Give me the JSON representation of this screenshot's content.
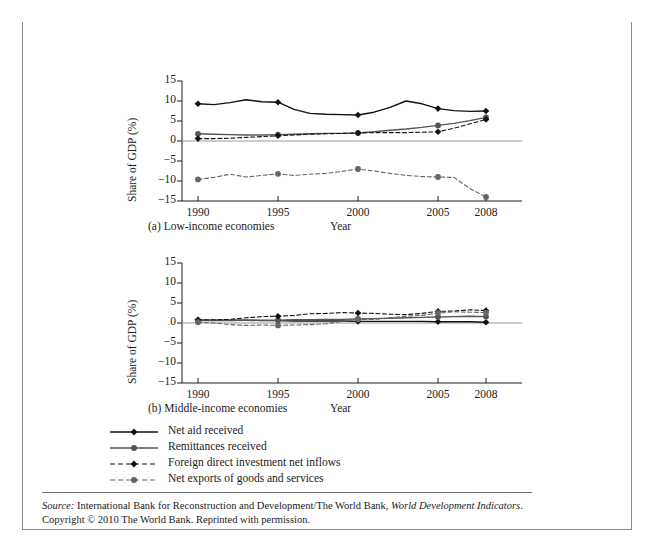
{
  "figure": {
    "number_label": "FIGURE 14.3",
    "title": "Sources of External Financing for Developing Countries, 1990–2008"
  },
  "source": {
    "label": "Source:",
    "line1_rest": " International Bank for Reconstruction and Development/The World Bank, ",
    "italic_work": "World Development Indicators",
    "line1_end": ".",
    "line2": "Copyright © 2010 The World Bank. Reprinted with permission."
  },
  "legend": {
    "items": [
      {
        "label": "Net aid received",
        "style": "solid",
        "marker": "diamond",
        "color": "#111111",
        "key": "net-aid-received"
      },
      {
        "label": "Remittances received",
        "style": "solid",
        "marker": "circle",
        "color": "#555555",
        "key": "remittances-received"
      },
      {
        "label": "Foreign direct investment net inflows",
        "style": "dashed",
        "marker": "diamond",
        "color": "#111111",
        "key": "fdi-net-inflows"
      },
      {
        "label": "Net exports of goods and services",
        "style": "dashed",
        "marker": "circle",
        "color": "#666666",
        "key": "net-exports"
      }
    ]
  },
  "chart_data": [
    {
      "type": "line",
      "id": "panel-a",
      "title": "(a) Low-income economies",
      "xlabel": "Year",
      "ylabel": "Share of GDP (%)",
      "xlim": [
        1989,
        2009
      ],
      "ylim": [
        -15,
        15
      ],
      "yticks": [
        15,
        10,
        5,
        0,
        -5,
        -10,
        -15
      ],
      "xticks": [
        1990,
        1995,
        2000,
        2005,
        2008
      ],
      "grid": false,
      "zero_line": true,
      "legend_position": "below-figure",
      "marker_years": [
        1990,
        1995,
        2000,
        2005,
        2008
      ],
      "x": [
        1990,
        1991,
        1992,
        1993,
        1994,
        1995,
        1996,
        1997,
        1998,
        1999,
        2000,
        2001,
        2002,
        2003,
        2004,
        2005,
        2006,
        2007,
        2008
      ],
      "series": [
        {
          "name": "Net aid received",
          "style": "solid",
          "marker": "diamond",
          "color": "#111111",
          "values": [
            9.3,
            9.1,
            9.6,
            10.3,
            9.8,
            9.7,
            7.9,
            6.9,
            6.7,
            6.6,
            6.5,
            7.2,
            8.4,
            10.0,
            9.3,
            8.1,
            7.6,
            7.4,
            7.5
          ]
        },
        {
          "name": "Remittances received",
          "style": "solid",
          "marker": "circle",
          "color": "#555555",
          "values": [
            1.8,
            1.7,
            1.6,
            1.5,
            1.5,
            1.6,
            1.7,
            1.8,
            1.9,
            1.9,
            2.0,
            2.3,
            2.7,
            3.0,
            3.4,
            3.9,
            4.4,
            5.1,
            5.9
          ]
        },
        {
          "name": "Foreign direct investment net inflows",
          "style": "dashed",
          "marker": "diamond",
          "color": "#111111",
          "values": [
            0.6,
            0.6,
            0.7,
            0.9,
            1.1,
            1.3,
            1.5,
            1.7,
            1.8,
            1.9,
            2.0,
            2.1,
            2.1,
            2.1,
            2.2,
            2.3,
            3.2,
            4.3,
            5.4
          ]
        },
        {
          "name": "Net exports of goods and services",
          "style": "dashed",
          "marker": "circle",
          "color": "#666666",
          "values": [
            -9.6,
            -9.1,
            -8.3,
            -9.0,
            -8.6,
            -8.2,
            -8.6,
            -8.3,
            -8.1,
            -7.6,
            -7.0,
            -7.5,
            -8.1,
            -8.6,
            -8.9,
            -9.0,
            -9.1,
            -11.9,
            -14.0
          ]
        }
      ]
    },
    {
      "type": "line",
      "id": "panel-b",
      "title": "(b) Middle-income economies",
      "xlabel": "Year",
      "ylabel": "Share of GDP (%)",
      "xlim": [
        1989,
        2009
      ],
      "ylim": [
        -15,
        15
      ],
      "yticks": [
        15,
        10,
        5,
        0,
        -5,
        -10,
        -15
      ],
      "xticks": [
        1990,
        1995,
        2000,
        2005,
        2008
      ],
      "grid": false,
      "zero_line": true,
      "legend_position": "below-figure",
      "marker_years": [
        1990,
        1995,
        2000,
        2005,
        2008
      ],
      "x": [
        1990,
        1991,
        1992,
        1993,
        1994,
        1995,
        1996,
        1997,
        1998,
        1999,
        2000,
        2001,
        2002,
        2003,
        2004,
        2005,
        2006,
        2007,
        2008
      ],
      "series": [
        {
          "name": "Net aid received",
          "style": "solid",
          "marker": "diamond",
          "color": "#111111",
          "values": [
            0.7,
            0.7,
            0.7,
            0.7,
            0.6,
            0.6,
            0.5,
            0.5,
            0.5,
            0.5,
            0.4,
            0.4,
            0.4,
            0.4,
            0.4,
            0.3,
            0.3,
            0.3,
            0.2
          ]
        },
        {
          "name": "Remittances received",
          "style": "solid",
          "marker": "circle",
          "color": "#555555",
          "values": [
            0.6,
            0.6,
            0.6,
            0.7,
            0.7,
            0.7,
            0.8,
            0.8,
            0.9,
            0.9,
            1.0,
            1.1,
            1.2,
            1.3,
            1.4,
            1.5,
            1.6,
            1.7,
            1.6
          ]
        },
        {
          "name": "Foreign direct investment net inflows",
          "style": "dashed",
          "marker": "diamond",
          "color": "#111111",
          "values": [
            0.8,
            0.8,
            0.9,
            1.3,
            1.6,
            1.7,
            1.9,
            2.3,
            2.4,
            2.6,
            2.5,
            2.4,
            2.2,
            2.1,
            2.4,
            2.9,
            3.0,
            3.3,
            3.1
          ]
        },
        {
          "name": "Net exports of goods and services",
          "style": "dashed",
          "marker": "circle",
          "color": "#666666",
          "values": [
            0.2,
            0.0,
            -0.4,
            -0.6,
            -0.5,
            -0.6,
            -0.5,
            -0.4,
            -0.2,
            0.4,
            0.9,
            0.9,
            1.3,
            1.7,
            1.9,
            2.5,
            2.8,
            2.7,
            2.6
          ]
        }
      ]
    }
  ]
}
